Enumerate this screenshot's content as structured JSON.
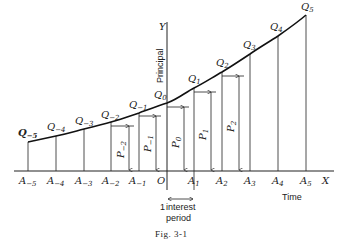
{
  "figure": {
    "caption": "Fig. 3-1",
    "y_axis_letter": "Y",
    "x_axis_letter": "X",
    "y_axis_title": "Principal",
    "x_axis_title": "Time",
    "origin_label": "O",
    "interval_label_line1": "1 interest",
    "interval_label_line2": "period",
    "interval_count": "1",
    "interval_word1": "interest",
    "interval_word2": "period"
  },
  "points": [
    {
      "a": "A",
      "asub": "−5",
      "q": "Q",
      "qsub": "−5",
      "x": 28,
      "y": 142
    },
    {
      "a": "A",
      "asub": "−4",
      "q": "Q",
      "qsub": "−4",
      "x": 56,
      "y": 136
    },
    {
      "a": "A",
      "asub": "−3",
      "q": "Q",
      "qsub": "−3",
      "x": 84,
      "y": 129
    },
    {
      "a": "A",
      "asub": "−2",
      "q": "Q",
      "qsub": "−2",
      "x": 111,
      "y": 122
    },
    {
      "a": "A",
      "asub": "−1",
      "q": "Q",
      "qsub": "−1",
      "x": 139,
      "y": 113
    },
    {
      "a": "",
      "asub": "",
      "q": "Q",
      "qsub": "0",
      "x": 167,
      "y": 103
    },
    {
      "a": "A",
      "asub": "1",
      "q": "Q",
      "qsub": "1",
      "x": 194,
      "y": 88
    },
    {
      "a": "A",
      "asub": "2",
      "q": "Q",
      "qsub": "2",
      "x": 222,
      "y": 72
    },
    {
      "a": "A",
      "asub": "3",
      "q": "Q",
      "qsub": "3",
      "x": 250,
      "y": 54
    },
    {
      "a": "A",
      "asub": "4",
      "q": "Q",
      "qsub": "4",
      "x": 278,
      "y": 36
    },
    {
      "a": "A",
      "asub": "5",
      "q": "Q",
      "qsub": "5",
      "x": 306,
      "y": 15
    }
  ],
  "principals": [
    {
      "p": "P",
      "psub": "−2"
    },
    {
      "p": "P",
      "psub": "−1"
    },
    {
      "p": "P",
      "psub": "0"
    },
    {
      "p": "P",
      "psub": "1"
    },
    {
      "p": "P",
      "psub": "2"
    }
  ]
}
